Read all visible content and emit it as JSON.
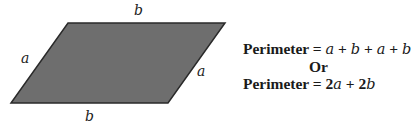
{
  "diagram": {
    "shape": "parallelogram",
    "fill_color": "#6e6e6e",
    "stroke_color": "#2a2a2a",
    "vertices": [
      [
        68,
        23
      ],
      [
        225,
        23
      ],
      [
        168,
        103
      ],
      [
        11,
        103
      ]
    ],
    "side_labels": {
      "top": "b",
      "bottom": "b",
      "left": "a",
      "right": "a"
    }
  },
  "formula": {
    "line1": {
      "prefix": "Perimeter = ",
      "terms": [
        "a",
        "b",
        "a",
        "b"
      ],
      "operator": "+"
    },
    "separator": "Or",
    "line2": {
      "prefix": "Perimeter = ",
      "term1_coef": "2",
      "term1_var": "a",
      "operator": "+",
      "term2_coef": "2",
      "term2_var": "b"
    }
  }
}
